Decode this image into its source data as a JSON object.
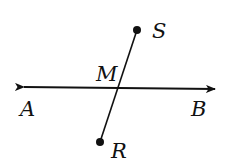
{
  "diagram": {
    "type": "geometry",
    "colors": {
      "stroke": "#111111",
      "background": "#ffffff"
    },
    "line_ab": {
      "start": {
        "x": 24,
        "y": 87
      },
      "end": {
        "x": 215,
        "y": 89
      },
      "arrows": "both"
    },
    "segment_rs": {
      "start": {
        "x": 100,
        "y": 142
      },
      "end": {
        "x": 137,
        "y": 30
      }
    },
    "points": {
      "S": {
        "x": 137,
        "y": 30,
        "label": "S",
        "label_x": 152,
        "label_y": 38
      },
      "R": {
        "x": 100,
        "y": 142,
        "label": "R",
        "label_x": 111,
        "label_y": 158
      },
      "M": {
        "x": 119,
        "y": 88,
        "label": "M",
        "label_x": 96,
        "label_y": 81
      },
      "A": {
        "label": "A",
        "label_x": 20,
        "label_y": 116
      },
      "B": {
        "label": "B",
        "label_x": 191,
        "label_y": 116
      }
    }
  }
}
